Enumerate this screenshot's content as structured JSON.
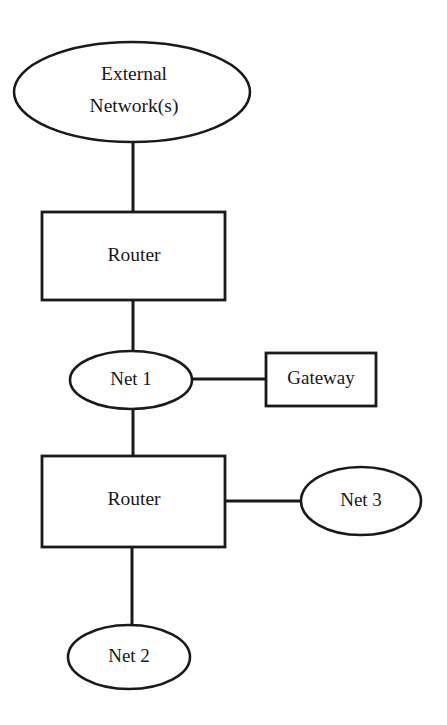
{
  "canvas": {
    "width": 447,
    "height": 725,
    "background": "#ffffff",
    "stroke_color": "#1a1a1a",
    "text_color": "#171717"
  },
  "diagram": {
    "type": "network-topology",
    "nodes": {
      "external_network": {
        "label_line1": "External",
        "label_line2": "Network(s)",
        "shape": "ellipse"
      },
      "router_top": {
        "label": "Router",
        "shape": "rectangle"
      },
      "net1": {
        "label": "Net 1",
        "shape": "ellipse"
      },
      "gateway": {
        "label": "Gateway",
        "shape": "rectangle"
      },
      "router_bottom": {
        "label": "Router",
        "shape": "rectangle"
      },
      "net3": {
        "label": "Net 3",
        "shape": "ellipse"
      },
      "net2": {
        "label": "Net 2",
        "shape": "ellipse"
      }
    },
    "connections": [
      {
        "from": "external_network",
        "to": "router_top",
        "orientation": "vertical"
      },
      {
        "from": "router_top",
        "to": "net1",
        "orientation": "vertical"
      },
      {
        "from": "net1",
        "to": "gateway",
        "orientation": "horizontal"
      },
      {
        "from": "net1",
        "to": "router_bottom",
        "orientation": "vertical"
      },
      {
        "from": "router_bottom",
        "to": "net3",
        "orientation": "horizontal"
      },
      {
        "from": "router_bottom",
        "to": "net2",
        "orientation": "vertical"
      }
    ]
  }
}
